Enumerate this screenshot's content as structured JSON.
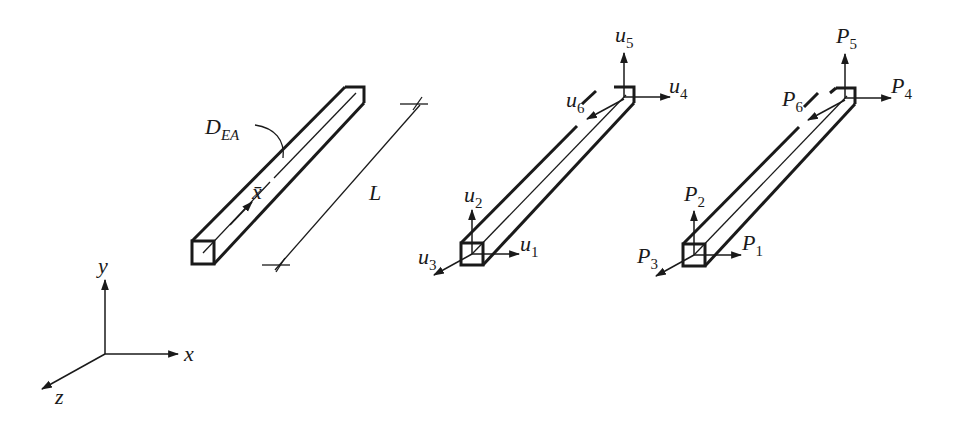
{
  "figure": {
    "type": "3D bar (truss) element diagram",
    "colors": {
      "ink": "#1a1a1a",
      "background": "#ffffff"
    }
  },
  "element_geometry": {
    "label_stiffness": "D",
    "label_stiffness_sub": "EA",
    "local_axis": "x̄",
    "length_label": "L"
  },
  "displacements": {
    "labels": [
      {
        "base": "u",
        "sub": "1"
      },
      {
        "base": "u",
        "sub": "2"
      },
      {
        "base": "u",
        "sub": "3"
      },
      {
        "base": "u",
        "sub": "4"
      },
      {
        "base": "u",
        "sub": "5"
      },
      {
        "base": "u",
        "sub": "6"
      }
    ]
  },
  "forces": {
    "labels": [
      {
        "base": "P",
        "sub": "1"
      },
      {
        "base": "P",
        "sub": "2"
      },
      {
        "base": "P",
        "sub": "3"
      },
      {
        "base": "P",
        "sub": "4"
      },
      {
        "base": "P",
        "sub": "5"
      },
      {
        "base": "P",
        "sub": "6"
      }
    ]
  },
  "global_axes": {
    "x": "x",
    "y": "y",
    "z": "z"
  }
}
